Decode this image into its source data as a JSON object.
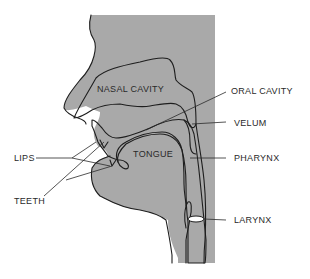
{
  "diagram": {
    "labels": {
      "nasal_cavity": "NASAL CAVITY",
      "oral_cavity": "ORAL CAVITY",
      "velum": "VELUM",
      "lips": "LIPS",
      "tongue": "TONGUE",
      "pharynx": "PHARYNX",
      "teeth": "TEETH",
      "larynx": "LARYNX"
    },
    "colors": {
      "tissue": "#a9a9a9",
      "airway": "#ffffff",
      "outline": "#1e1e1e",
      "text": "#2a2a2a"
    }
  }
}
